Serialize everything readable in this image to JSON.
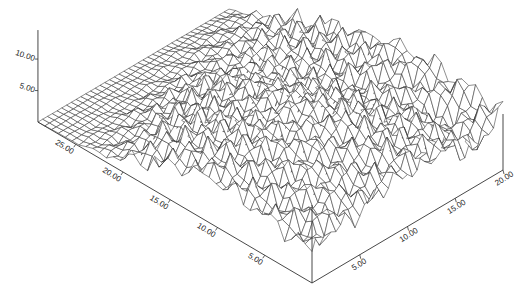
{
  "chart_data": {
    "type": "surface-wireframe",
    "title": "",
    "xlabel": "",
    "ylabel": "",
    "zlabel": "",
    "x_axis": {
      "range": [
        0,
        20
      ],
      "ticks": [
        "5.00",
        "10.00",
        "15.00",
        "20.00"
      ],
      "tick_values": [
        5,
        10,
        15,
        20
      ]
    },
    "y_axis": {
      "range": [
        0,
        29
      ],
      "ticks": [
        "5.00",
        "10.00",
        "15.00",
        "20.00",
        "25.00"
      ],
      "tick_values": [
        5,
        10,
        15,
        20,
        25
      ]
    },
    "z_axis": {
      "range": [
        0,
        14
      ],
      "ticks": [
        "5.00",
        "10.00"
      ],
      "tick_values": [
        5,
        10
      ]
    },
    "grid": false,
    "legend": "none",
    "mesh_resolution": {
      "nx": 40,
      "ny": 40
    },
    "height_grid_note": "coarse z samples, rows = y from 29 (back-left) to 0 (front), cols = x from 0 to 20",
    "height_grid": [
      [
        0.0,
        0.0,
        0.0,
        0.0,
        0.0,
        0.0,
        0.0,
        0.0,
        0.0
      ],
      [
        0.2,
        0.3,
        0.5,
        0.6,
        0.8,
        1.2,
        1.5,
        1.8,
        2.0
      ],
      [
        1.0,
        1.5,
        2.5,
        3.0,
        3.5,
        3.0,
        3.5,
        4.0,
        4.5
      ],
      [
        3.5,
        5.0,
        6.0,
        5.5,
        6.5,
        5.0,
        5.5,
        6.0,
        7.0
      ],
      [
        6.0,
        7.5,
        8.0,
        7.0,
        8.5,
        7.0,
        6.5,
        7.5,
        8.5
      ],
      [
        7.5,
        8.5,
        9.5,
        9.0,
        10.5,
        9.0,
        7.0,
        9.0,
        10.0
      ],
      [
        7.0,
        8.0,
        9.0,
        10.0,
        11.0,
        10.0,
        8.0,
        8.0,
        10.5
      ],
      [
        6.0,
        7.5,
        8.5,
        9.0,
        10.5,
        9.5,
        9.0,
        5.0,
        10.0
      ],
      [
        5.0,
        6.5,
        7.0,
        8.0,
        9.0,
        8.5,
        8.0,
        6.0,
        9.5
      ]
    ],
    "annotations": []
  },
  "axes": {
    "z_ticks": [
      {
        "label": "10.00"
      },
      {
        "label": "5.00"
      }
    ],
    "y_ticks": [
      {
        "label": "25.00"
      },
      {
        "label": "20.00"
      },
      {
        "label": "15.00"
      },
      {
        "label": "10.00"
      },
      {
        "label": "5.00"
      }
    ],
    "x_ticks": [
      {
        "label": "5.00"
      },
      {
        "label": "10.00"
      },
      {
        "label": "15.00"
      },
      {
        "label": "20.00"
      }
    ]
  },
  "colors": {
    "line": "#333333",
    "background": "#ffffff"
  }
}
